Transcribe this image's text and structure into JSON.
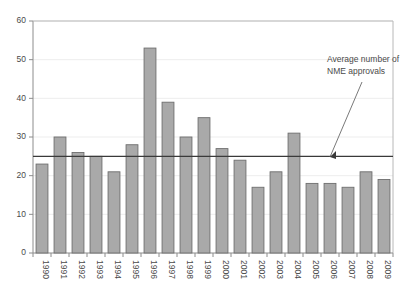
{
  "chart_data": {
    "type": "bar",
    "title": "",
    "subtitle": "",
    "xlabel": "",
    "ylabel": "",
    "categories": [
      "1990",
      "1991",
      "1992",
      "1993",
      "1994",
      "1995",
      "1996",
      "1997",
      "1998",
      "1999",
      "2000",
      "2001",
      "2002",
      "2003",
      "2004",
      "2005",
      "2006",
      "2007",
      "2008",
      "2009"
    ],
    "values": [
      23,
      30,
      26,
      25,
      21,
      28,
      53,
      39,
      30,
      35,
      27,
      24,
      17,
      21,
      31,
      18,
      18,
      17,
      21,
      19
    ],
    "series": [
      {
        "name": "NME approvals",
        "values": [
          23,
          30,
          26,
          25,
          21,
          28,
          53,
          39,
          30,
          35,
          27,
          24,
          17,
          21,
          31,
          18,
          18,
          17,
          21,
          19
        ]
      }
    ],
    "ylim": [
      0,
      60
    ],
    "yticks": [
      0,
      10,
      20,
      30,
      40,
      50,
      60
    ],
    "ytick_labels": [
      "0",
      "10",
      "20",
      "30",
      "40",
      "50",
      "60"
    ],
    "grid": "horizontal-faint",
    "legend": "none",
    "reference_line": {
      "label": "Average number of NME approvals",
      "value": 25,
      "orientation": "horizontal"
    },
    "annotations": [
      {
        "text_line_1": "Average number of",
        "text_line_2": "NME approvals",
        "points_to": "reference-line"
      }
    ],
    "colors": {
      "bar_fill": "#a9a9a9",
      "bar_stroke": "#6e6e6e",
      "axis": "#808080",
      "reference_line": "#3a3a3a",
      "text": "#4a4a4a",
      "background": "#ffffff"
    }
  },
  "annotation": {
    "line1": "Average number of",
    "line2": "NME approvals"
  }
}
